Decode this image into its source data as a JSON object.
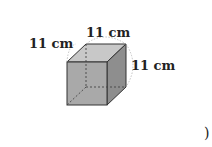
{
  "figure": {
    "shape": "cube",
    "labels": {
      "left_edge": "11 cm",
      "top_edge": "11 cm",
      "right_edge": "11 cm"
    },
    "closing_paren": ")",
    "colors": {
      "front_face": "#a9a9a9",
      "top_face": "#c8c8c8",
      "side_face": "#8e8e8e",
      "edge": "#333333",
      "hidden_edge": "#444444",
      "dim_arc": "#aaaaaa"
    }
  }
}
